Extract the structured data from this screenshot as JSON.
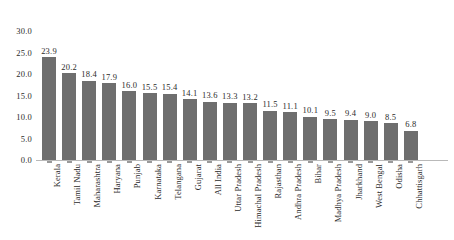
{
  "chart_data": {
    "type": "bar",
    "title": "",
    "subtitle": "",
    "xlabel": "",
    "ylabel": "",
    "ylim": [
      0,
      30
    ],
    "ytick_step": 5,
    "grid": false,
    "legend": false,
    "bar_color": "#6e6e6e",
    "axis_color": "#b9b9b9",
    "text_color": "#2b2b2b",
    "background": "#ffffff",
    "data_labels_shown": true,
    "ytick_labels": [
      "30.0",
      "25.0",
      "20.0",
      "15.0",
      "10.0",
      "5.0",
      "0.0"
    ],
    "yticks": [
      30,
      25,
      20,
      15,
      10,
      5,
      0
    ],
    "categories": [
      "Kerala",
      "Tamil Nadu",
      "Maharashtra",
      "Haryana",
      "Punjab",
      "Karnataka",
      "Telangana",
      "Gujarat",
      "All India",
      "Uttar Pradesh",
      "Himachal Pradesh",
      "Rajasthan",
      "Andhra Pradesh",
      "Bihar",
      "Madhya Pradesh",
      "Jharkhand",
      "West Bengal",
      "Odisha",
      "Chhattisgarh"
    ],
    "values": [
      23.9,
      20.2,
      18.4,
      17.9,
      16.0,
      15.5,
      15.4,
      14.1,
      13.6,
      13.3,
      13.2,
      11.5,
      11.1,
      10.1,
      9.5,
      9.4,
      9.0,
      8.5,
      6.8
    ],
    "value_labels": [
      "23.9",
      "20.2",
      "18.4",
      "17.9",
      "16.0",
      "15.5",
      "15.4",
      "14.1",
      "13.6",
      "13.3",
      "13.2",
      "11.5",
      "11.1",
      "10.1",
      "9.5",
      "9.4",
      "9.0",
      "8.5",
      "6.8"
    ]
  }
}
